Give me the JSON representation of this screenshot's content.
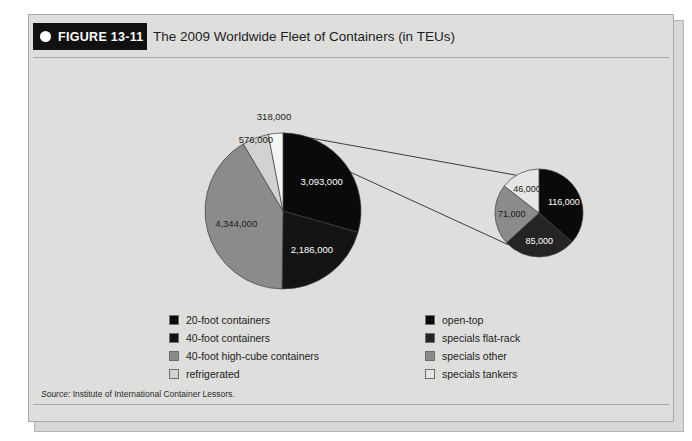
{
  "figure": {
    "tab_label": "FIGURE 13-11",
    "title": "The 2009 Worldwide Fleet of Containers (in TEUs)",
    "source_prefix": "Source:",
    "source_text": " Institute of International Container Lessors."
  },
  "legend_left": {
    "items": [
      {
        "label": "20-foot containers",
        "color": "#0a0a0a"
      },
      {
        "label": "40-foot containers",
        "color": "#141414"
      },
      {
        "label": "40-foot high-cube containers",
        "color": "#8b8b8b"
      },
      {
        "label": "refrigerated",
        "color": "#d2d2d0"
      }
    ]
  },
  "legend_right": {
    "items": [
      {
        "label": "open-top",
        "color": "#0a0a0a"
      },
      {
        "label": "specials flat-rack",
        "color": "#242424"
      },
      {
        "label": "specials other",
        "color": "#8b8b8b"
      },
      {
        "label": "specials tankers",
        "color": "#e6e6e4"
      }
    ]
  },
  "chart_data": {
    "type": "pie",
    "title": "The 2009 Worldwide Fleet of Containers (in TEUs)",
    "subtitle": "",
    "xlabel": "",
    "ylabel": "",
    "units": "TEUs",
    "legend_position": "bottom",
    "grid": false,
    "main_pie": {
      "name": "Worldwide fleet of containers",
      "center": [
        254,
        196
      ],
      "radius": 78,
      "start_angle_deg": 0,
      "direction": "clockwise",
      "categories": [
        "20-foot containers",
        "40-foot containers",
        "40-foot high-cube containers",
        "refrigerated",
        "specials"
      ],
      "values": [
        3093000,
        2186000,
        4344000,
        576000,
        318000
      ],
      "labels": [
        "3,093,000",
        "2,186,000",
        "4,344,000",
        "576,000",
        "318,000"
      ],
      "colors": [
        "#0a0a0a",
        "#141414",
        "#8b8b8b",
        "#d2d2d0",
        "#f4f4f2"
      ],
      "total": 10517000
    },
    "detail_pie": {
      "name": "specials (318,000 TEUs) breakdown",
      "center": [
        510,
        198
      ],
      "radius": 44,
      "start_angle_deg": 0,
      "direction": "clockwise",
      "categories": [
        "open-top",
        "specials flat-rack",
        "specials other",
        "specials tankers"
      ],
      "values": [
        116000,
        85000,
        71000,
        46000
      ],
      "labels": [
        "116,000",
        "85,000",
        "71,000",
        "46,000"
      ],
      "colors": [
        "#0a0a0a",
        "#242424",
        "#8b8b8b",
        "#e6e6e4"
      ],
      "total": 318000
    },
    "slice_label_text": {
      "main_3093000": "3,093,000",
      "main_2186000": "2,186,000",
      "main_4344000": "4,344,000",
      "main_576000": "576,000",
      "main_318000": "318,000",
      "detail_116000": "116,000",
      "detail_85000": "85,000",
      "detail_71000": "71,000",
      "detail_46000": "46,000"
    }
  }
}
